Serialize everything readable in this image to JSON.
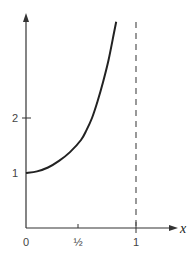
{
  "chart_data": {
    "type": "line",
    "title": "",
    "xlabel": "x",
    "ylabel": "",
    "xlim": [
      0,
      1.35
    ],
    "ylim": [
      0,
      3.9
    ],
    "grid": false,
    "legend": null,
    "x_ticks": [
      {
        "value": 0,
        "label": "0"
      },
      {
        "value": 0.5,
        "label": "½"
      },
      {
        "value": 1,
        "label": "1"
      }
    ],
    "y_ticks": [
      {
        "value": 1,
        "label": "1"
      },
      {
        "value": 2,
        "label": "2"
      }
    ],
    "series": [
      {
        "name": "curve",
        "style": "solid",
        "x": [
          0,
          0.1,
          0.2,
          0.3,
          0.4,
          0.5,
          0.55,
          0.6,
          0.65,
          0.7,
          0.75,
          0.8,
          0.82
        ],
        "y": [
          1.0,
          1.03,
          1.1,
          1.22,
          1.38,
          1.6,
          1.78,
          2.0,
          2.3,
          2.65,
          3.05,
          3.55,
          3.75
        ]
      }
    ],
    "annotations": [
      {
        "type": "vline",
        "x": 1,
        "style": "dashed",
        "note": "vertical asymptote at x = 1"
      }
    ]
  },
  "labels": {
    "x0": "0",
    "xhalf": "½",
    "x1": "1",
    "y1": "1",
    "y2": "2",
    "xaxis": "x"
  }
}
